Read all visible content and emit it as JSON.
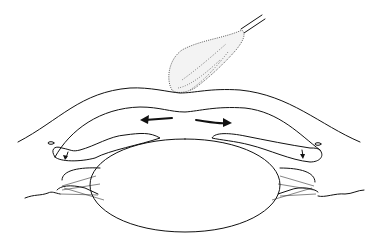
{
  "figure": {
    "labels": [],
    "colors": {
      "line": "#111111",
      "background": "#ffffff",
      "stipple": "#222222"
    }
  }
}
